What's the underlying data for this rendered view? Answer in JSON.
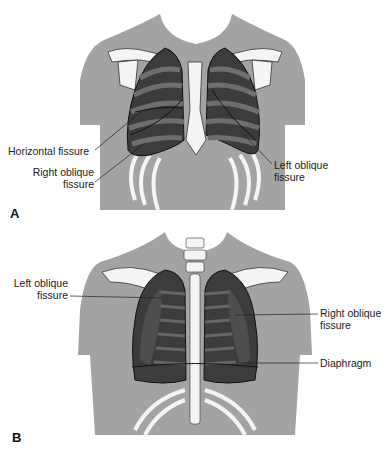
{
  "figure": {
    "panels": [
      {
        "letter": "A",
        "view": "anterior chest",
        "labels": {
          "horizontal_fissure": "Horizontal fissure",
          "right_oblique_line1": "Right oblique",
          "right_oblique_line2": "fissure",
          "left_oblique_line1": "Left oblique",
          "left_oblique_line2": "fissure"
        }
      },
      {
        "letter": "B",
        "view": "posterior chest",
        "labels": {
          "left_oblique_line1": "Left oblique",
          "left_oblique_line2": "fissure",
          "right_oblique_line1": "Right oblique",
          "right_oblique_line2": "fissure",
          "diaphragm": "Diaphragm"
        }
      }
    ],
    "colors": {
      "skin": "#a3a3a3",
      "lung": "#3c3c3c",
      "rib_band": "#6e6e6e",
      "bone": "#f4f4f4",
      "outline": "#222222"
    }
  }
}
